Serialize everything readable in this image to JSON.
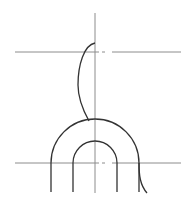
{
  "drawing": {
    "width": 191,
    "height": 203,
    "background": "#ffffff",
    "colors": {
      "centerline": "#8c8c8c",
      "outline": "#333333"
    },
    "centerlines": {
      "vertical": {
        "x": 95,
        "y1": 13,
        "y2": 193
      },
      "horizontal_top": {
        "y": 52,
        "x1": 15,
        "x2": 181,
        "gap": [
          99,
          112
        ]
      },
      "horizontal_bottom": {
        "y": 163,
        "x1": 15,
        "x2": 181,
        "gap": [
          99,
          112
        ]
      }
    },
    "arch": {
      "center_x": 95,
      "center_y": 163,
      "outer_radius": 44,
      "inner_radius": 22,
      "leg_bottom_y": 192
    },
    "break_curves": {
      "upper": "M95,43 C84,45 78,65 78,85 C78,100 84,112 89,121",
      "lower": "M139,163 C139,175 140,185 147,193"
    }
  }
}
